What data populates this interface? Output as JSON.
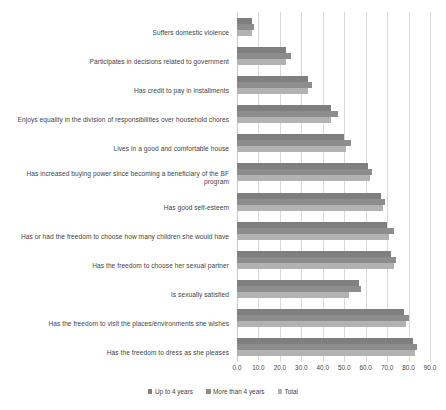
{
  "chart_data": {
    "type": "bar",
    "orientation": "horizontal",
    "title": "",
    "xlabel": "",
    "ylabel": "",
    "xlim": [
      0,
      90
    ],
    "xticks": [
      "0.0",
      "10.0",
      "20.0",
      "30.0",
      "40.0",
      "50.0",
      "60.0",
      "70.0",
      "80.0",
      "90.0"
    ],
    "grid": true,
    "legend_position": "bottom",
    "categories": [
      "Suffers domestic violence",
      "Participates in decisions related to government",
      "Has credit to pay in installments",
      "Enjoys equality in the division of responsibilities over household chores",
      "Lives in a good and comfortable house",
      "Has increased buying power since becoming a beneficiary of the BF program",
      "Has good self-esteem",
      "Has or had the freedom to choose how many children she would have",
      "Has the freedom to choose her sexual partner",
      "Is sexually satisfied",
      "Has the freedom to visit the places/environments she wishes",
      "Has the freedom to dress as she pleases"
    ],
    "series": [
      {
        "name": "Up to 4 years",
        "color": "#7f7f7f",
        "values": [
          7.0,
          23.0,
          33.0,
          44.0,
          50.0,
          61.0,
          67.0,
          70.0,
          72.0,
          57.0,
          78.0,
          82.0
        ]
      },
      {
        "name": "More than 4 years",
        "color": "#8d8d8d",
        "values": [
          8.0,
          25.0,
          35.0,
          47.0,
          53.0,
          63.0,
          69.0,
          73.0,
          74.0,
          58.0,
          80.0,
          84.0
        ]
      },
      {
        "name": "Total",
        "color": "#b2b2b2",
        "values": [
          7.0,
          23.0,
          33.0,
          44.0,
          51.0,
          62.0,
          68.0,
          71.0,
          73.0,
          52.0,
          79.0,
          83.0
        ]
      }
    ]
  },
  "legend": {
    "items": [
      {
        "label": "Up to 4 years"
      },
      {
        "label": "More than 4 years"
      },
      {
        "label": "Total"
      }
    ]
  }
}
